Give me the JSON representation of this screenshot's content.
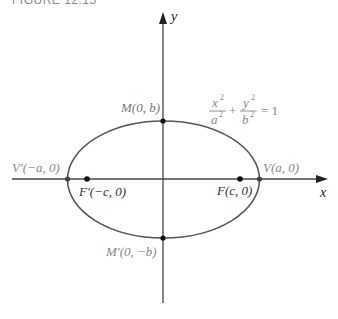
{
  "figure": {
    "label": "FIGURE 12.15"
  },
  "axes": {
    "x_label": "x",
    "y_label": "y"
  },
  "equation": {
    "x_num": "x",
    "x_den": "a",
    "y_num": "y",
    "y_den": "b",
    "exp": "2",
    "plus": "+",
    "equals": "= 1"
  },
  "points": {
    "M": "M(0, b)",
    "M_prime": "M′(0, −b)",
    "V": "V(a, 0)",
    "V_prime": "V′(−a, 0)",
    "F": "F(c, 0)",
    "F_prime": "F′(−c, 0)"
  },
  "colors": {
    "axis": "#444444",
    "ellipse": "#555555",
    "point": "#111111",
    "label_gray": "#888888",
    "label_dark": "#222222"
  }
}
